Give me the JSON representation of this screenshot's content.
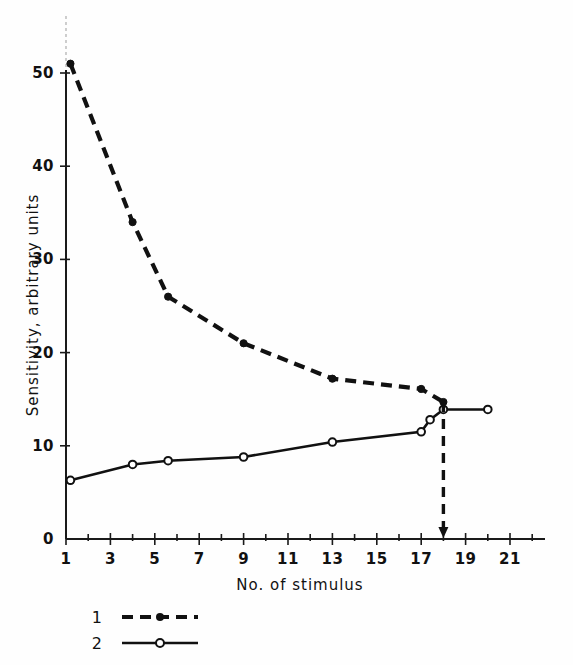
{
  "figure": {
    "background_color": "#fefefe",
    "ink_color": "#111111"
  },
  "chart_data": {
    "type": "line",
    "title": "",
    "subtitle": "",
    "xlabel": "No. of stimulus",
    "ylabel": "Sensitivity,  arbitrary units",
    "xlim": [
      1,
      22
    ],
    "ylim": [
      0,
      55
    ],
    "grid": false,
    "legend_position": "below-axes-left",
    "x_ticks": [
      1,
      3,
      5,
      7,
      9,
      11,
      13,
      15,
      17,
      19,
      21
    ],
    "x_tick_labels": [
      "1",
      "3",
      "5",
      "7",
      "9",
      "11",
      "13",
      "15",
      "17",
      "19",
      "21"
    ],
    "x_minor_ticks": [
      2,
      4,
      6,
      8,
      10,
      12,
      14,
      16,
      18,
      20,
      22
    ],
    "y_ticks": [
      0,
      10,
      20,
      30,
      40,
      50
    ],
    "y_tick_labels": [
      "0",
      "10",
      "20",
      "30",
      "40",
      "50"
    ],
    "series": [
      {
        "name": "1",
        "legend_label": "1",
        "line_style": "dashed",
        "marker": "filled-circle",
        "color": "#111111",
        "x": [
          1.2,
          4.0,
          5.6,
          9.0,
          13.0,
          17.0,
          18.0
        ],
        "values": [
          51.0,
          34.0,
          26.0,
          21.0,
          17.2,
          16.1,
          14.7
        ]
      },
      {
        "name": "2",
        "legend_label": "2",
        "line_style": "solid",
        "marker": "open-circle",
        "color": "#111111",
        "x": [
          1.2,
          4.0,
          5.6,
          9.0,
          13.0,
          17.0,
          17.4,
          18.0,
          20.0
        ],
        "values": [
          6.3,
          8.0,
          8.4,
          8.8,
          10.4,
          11.5,
          12.8,
          13.9,
          13.9
        ]
      }
    ],
    "annotations": [
      {
        "name": "stimulus-marker-arrow",
        "type": "vertical-dashed-arrow",
        "x": 18.0,
        "y_from": 14.7,
        "y_to": 0.0,
        "arrow_head": "down"
      }
    ]
  },
  "legend": {
    "entries": [
      {
        "label": "1",
        "style": "dashed",
        "marker": "filled-circle"
      },
      {
        "label": "2",
        "style": "solid",
        "marker": "open-circle"
      }
    ]
  }
}
